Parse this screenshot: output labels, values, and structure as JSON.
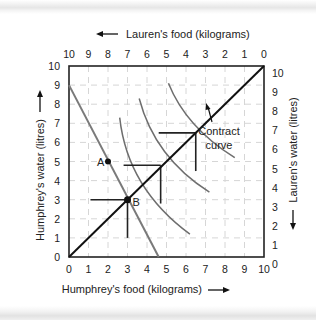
{
  "chart_data": {
    "type": "edgeworth-box",
    "title": "",
    "top_axis": {
      "label": "Lauren's food (kilograms)",
      "arrow": "left",
      "ticks": [
        "10",
        "9",
        "8",
        "7",
        "6",
        "5",
        "4",
        "3",
        "2",
        "1",
        "0"
      ]
    },
    "bottom_axis": {
      "label": "Humphrey's food (kilograms)",
      "arrow": "right",
      "ticks": [
        "0",
        "1",
        "2",
        "3",
        "4",
        "5",
        "6",
        "7",
        "8",
        "9",
        "10"
      ]
    },
    "left_axis": {
      "label": "Humphrey's water (litres)",
      "arrow": "up",
      "ticks": [
        "0",
        "1",
        "2",
        "3",
        "4",
        "5",
        "6",
        "7",
        "8",
        "9",
        "10"
      ]
    },
    "right_axis": {
      "label": "Lauren's water (litres)",
      "arrow": "down",
      "ticks": [
        "0",
        "1",
        "2",
        "3",
        "4",
        "5",
        "6",
        "7",
        "8",
        "9",
        "10"
      ]
    },
    "xlim": [
      0,
      10
    ],
    "ylim": [
      0,
      10
    ],
    "grid": "dashed",
    "contract_curve": {
      "label_line1": "Contract",
      "label_line2": "curve",
      "from": [
        0,
        0
      ],
      "to": [
        10,
        10
      ]
    },
    "budget_line": {
      "from": [
        0,
        9
      ],
      "to": [
        4.6,
        0
      ]
    },
    "points": [
      {
        "name": "A",
        "x": 2,
        "y": 5
      },
      {
        "name": "B",
        "x": 3,
        "y": 3
      }
    ],
    "tangency_points": [
      {
        "x": 3,
        "y": 3
      },
      {
        "x": 4.7,
        "y": 4.8
      },
      {
        "x": 6.5,
        "y": 6.5
      }
    ]
  }
}
